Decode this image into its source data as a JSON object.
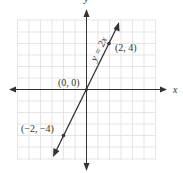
{
  "graph": {
    "equation_label": "y = 2x",
    "axis_x_label": "x",
    "axis_y_label": "y",
    "points": [
      {
        "label": "(2, 4)",
        "x": 2,
        "y": 4
      },
      {
        "label": "(0, 0)",
        "x": 0,
        "y": 0
      },
      {
        "label": "(−2, −4)",
        "x": -2,
        "y": -4
      }
    ],
    "grid": {
      "xmin": -6,
      "xmax": 6,
      "ymin": -6,
      "ymax": 6,
      "step": 1
    },
    "colors": {
      "grid": "#dcdcdc",
      "axis": "#333333",
      "line": "#333333"
    }
  }
}
